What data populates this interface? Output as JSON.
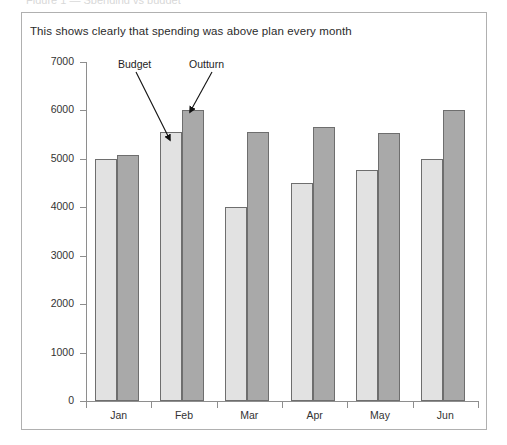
{
  "page": {
    "top_sliver_text": "Figure 1 — Spending vs budget",
    "frame_border_color": "#b0b0b0"
  },
  "figure": {
    "title": "This shows clearly that spending was above plan every month"
  },
  "annotations": [
    {
      "name": "budget",
      "label": "Budget",
      "target_month": "Feb",
      "target_series": "Budget"
    },
    {
      "name": "outturn",
      "label": "Outturn",
      "target_month": "Feb",
      "target_series": "Outturn"
    }
  ],
  "colors": {
    "budget_bar": "#e2e2e2",
    "outturn_bar": "#a9a9a9",
    "bar_border": "#6e6e6e",
    "axis": "#8e8e8e",
    "text": "#333333"
  },
  "chart_data": {
    "type": "bar",
    "title": "This shows clearly that spending was above plan every month",
    "xlabel": "",
    "ylabel": "",
    "categories": [
      "Jan",
      "Feb",
      "Mar",
      "Apr",
      "May",
      "Jun"
    ],
    "series": [
      {
        "name": "Budget",
        "color": "#e2e2e2",
        "values": [
          5000,
          5550,
          4000,
          4500,
          4780,
          5000
        ]
      },
      {
        "name": "Outturn",
        "color": "#a9a9a9",
        "values": [
          5080,
          6000,
          5550,
          5650,
          5540,
          6000
        ]
      }
    ],
    "ylim": [
      0,
      7000
    ],
    "yticks": [
      0,
      1000,
      2000,
      3000,
      4000,
      5000,
      6000,
      7000
    ],
    "ytick_labels": [
      "0",
      "1000",
      "2000",
      "3000",
      "4000",
      "5000",
      "6000",
      "7000"
    ],
    "grid": false,
    "legend": "none-inline-annotations"
  }
}
